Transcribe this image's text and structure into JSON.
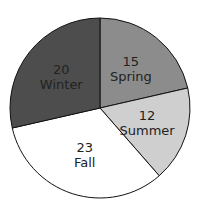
{
  "chart_data": {
    "type": "pie",
    "title": "",
    "categories": [
      "Spring",
      "Summer",
      "Fall",
      "Winter"
    ],
    "values": [
      15,
      12,
      23,
      20
    ],
    "colors": [
      "#8c8c8c",
      "#cfcfcf",
      "#ffffff",
      "#4d4d4d"
    ],
    "start_angle_deg": 0,
    "direction": "clockwise",
    "labels": [
      {
        "value": "15",
        "name": "Spring"
      },
      {
        "value": "12",
        "name": "Summer"
      },
      {
        "value": "23",
        "name": "Fall"
      },
      {
        "value": "20",
        "name": "Winter"
      }
    ],
    "legend": "none"
  }
}
